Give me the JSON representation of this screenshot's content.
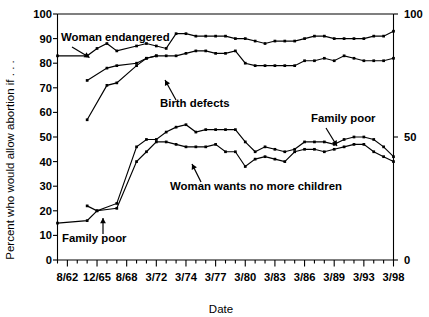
{
  "chart_data": {
    "type": "line",
    "title": "",
    "xlabel": "Date",
    "ylabel": "Percent who would allow abortion if . . .",
    "ylim": [
      0,
      100
    ],
    "ytick_step": 10,
    "grid": false,
    "legend_position": "inline-annotations",
    "yticks_left": [
      "0",
      "10",
      "20",
      "30",
      "40",
      "50",
      "60",
      "70",
      "80",
      "90",
      "100"
    ],
    "yticks_right": [
      "0",
      "50",
      "100"
    ],
    "xticks_labeled": [
      "8/62",
      "12/65",
      "8/68",
      "3/72",
      "3/74",
      "3/77",
      "3/80",
      "3/83",
      "3/86",
      "3/89",
      "3/93",
      "3/98"
    ],
    "x_minor_ticks_between_labels": 3,
    "annotations": [
      {
        "text": "Woman endangered",
        "series": "woman_endangered"
      },
      {
        "text": "Birth defects",
        "series": "birth_defects"
      },
      {
        "text": "Family poor",
        "series": "family_poor_upper"
      },
      {
        "text": "Woman wants no more children",
        "series": "woman_wants_no_more"
      },
      {
        "text": "Family poor",
        "series": "family_poor_lower"
      }
    ],
    "series": [
      {
        "name": "Woman endangered",
        "x": [
          0,
          3,
          4,
          5,
          6,
          8,
          9,
          10,
          11,
          12,
          13,
          14,
          15,
          16,
          17,
          18,
          19,
          20,
          21,
          22,
          23,
          24,
          25,
          26,
          27,
          28,
          29,
          30,
          31,
          32,
          33,
          34
        ],
        "values": [
          83,
          83,
          86,
          88,
          85,
          87,
          88,
          87,
          86,
          92,
          92,
          91,
          91,
          91,
          91,
          90,
          90,
          89,
          88,
          89,
          89,
          89,
          90,
          91,
          91,
          90,
          90,
          90,
          90,
          91,
          91,
          93
        ]
      },
      {
        "name": "Birth defects",
        "x": [
          3,
          5,
          6,
          8,
          9,
          10,
          11,
          12,
          13,
          14,
          15,
          16,
          17,
          18,
          19,
          20,
          21,
          22,
          23,
          24,
          25,
          26,
          27,
          28,
          29,
          30,
          31,
          32,
          33,
          34
        ],
        "values": [
          73,
          78,
          79,
          80,
          82,
          83,
          83,
          83,
          84,
          85,
          85,
          84,
          84,
          85,
          80,
          79,
          79,
          79,
          79,
          79,
          81,
          81,
          82,
          81,
          83,
          82,
          81,
          81,
          81,
          82
        ]
      },
      {
        "name": "Family poor (upper branch)",
        "x": [
          3,
          5,
          6,
          8,
          9,
          10
        ],
        "values": [
          57,
          71,
          72,
          79,
          82,
          83
        ]
      },
      {
        "name": "Family poor",
        "x": [
          3,
          4,
          6,
          8,
          9,
          10,
          11,
          12,
          13,
          14,
          15,
          16,
          17,
          18,
          19,
          20,
          21,
          22,
          23,
          24,
          25,
          26,
          27,
          28,
          29,
          30,
          31,
          32,
          33,
          34
        ],
        "values": [
          22,
          20,
          23,
          46,
          49,
          49,
          52,
          54,
          55,
          52,
          53,
          53,
          53,
          53,
          48,
          44,
          46,
          45,
          44,
          45,
          48,
          48,
          48,
          47,
          49,
          50,
          50,
          49,
          46,
          42
        ]
      },
      {
        "name": "Woman wants no more children",
        "x": [
          0,
          3,
          4,
          6,
          8,
          9,
          10,
          11,
          12,
          13,
          14,
          15,
          16,
          17,
          18,
          19,
          20,
          21,
          22,
          23,
          24,
          25,
          26,
          27,
          28,
          29,
          30,
          31,
          32,
          33,
          34
        ],
        "values": [
          15,
          16,
          20,
          21,
          40,
          44,
          48,
          48,
          47,
          46,
          46,
          46,
          47,
          44,
          44,
          38,
          41,
          42,
          41,
          40,
          44,
          45,
          45,
          44,
          45,
          46,
          47,
          47,
          44,
          42,
          40
        ]
      }
    ]
  },
  "axis": {
    "y_label": "Percent who would allow abortion if . . .",
    "x_label": "Date"
  },
  "labels": {
    "woman_endangered": "Woman endangered",
    "birth_defects": "Birth defects",
    "family_poor_top": "Family poor",
    "family_poor_bottom": "Family poor",
    "woman_wants_no_more": "Woman wants no more children"
  },
  "colors": {
    "line": "#000000",
    "background": "#ffffff",
    "text": "#000000"
  }
}
